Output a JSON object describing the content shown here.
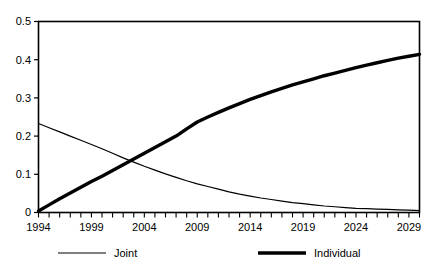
{
  "chart_data": {
    "type": "line",
    "title": "",
    "subtitle": "",
    "xlabel": "",
    "ylabel": "",
    "xlim": [
      1994,
      2030
    ],
    "ylim": [
      0,
      0.5
    ],
    "grid": false,
    "legend_position": "bottom",
    "x_tick_labels": [
      "1994",
      "1999",
      "2004",
      "2009",
      "2014",
      "2019",
      "2024",
      "2029"
    ],
    "x_tick_values": [
      1994,
      1999,
      2004,
      2009,
      2014,
      2019,
      2024,
      2029
    ],
    "x_minor_tick_step": 1,
    "y_tick_labels": [
      "0",
      "0.1",
      "0.2",
      "0.3",
      "0.4",
      "0.5"
    ],
    "y_tick_values": [
      0,
      0.1,
      0.2,
      0.3,
      0.4,
      0.5
    ],
    "x": [
      1994,
      1995,
      1996,
      1997,
      1998,
      1999,
      2000,
      2001,
      2002,
      2003,
      2004,
      2005,
      2006,
      2007,
      2008,
      2009,
      2010,
      2011,
      2012,
      2013,
      2014,
      2015,
      2016,
      2017,
      2018,
      2019,
      2020,
      2021,
      2022,
      2023,
      2024,
      2025,
      2026,
      2027,
      2028,
      2029,
      2030
    ],
    "series": [
      {
        "name": "Joint",
        "line_style": "thin",
        "color": "#000000",
        "values": [
          0.233,
          0.222,
          0.211,
          0.2,
          0.189,
          0.178,
          0.167,
          0.155,
          0.143,
          0.132,
          0.121,
          0.111,
          0.101,
          0.092,
          0.083,
          0.075,
          0.068,
          0.061,
          0.054,
          0.048,
          0.043,
          0.038,
          0.034,
          0.03,
          0.026,
          0.023,
          0.02,
          0.017,
          0.015,
          0.013,
          0.011,
          0.01,
          0.009,
          0.008,
          0.007,
          0.006,
          0.005
        ]
      },
      {
        "name": "Individual",
        "line_style": "thick",
        "color": "#000000",
        "values": [
          0.004,
          0.02,
          0.036,
          0.051,
          0.066,
          0.081,
          0.095,
          0.11,
          0.125,
          0.14,
          0.155,
          0.17,
          0.185,
          0.2,
          0.219,
          0.237,
          0.25,
          0.262,
          0.274,
          0.285,
          0.296,
          0.306,
          0.316,
          0.325,
          0.334,
          0.342,
          0.35,
          0.358,
          0.365,
          0.372,
          0.379,
          0.386,
          0.392,
          0.398,
          0.404,
          0.409,
          0.414
        ]
      }
    ],
    "legend": [
      {
        "label": "Joint",
        "style": "thin"
      },
      {
        "label": "Individual",
        "style": "thick"
      }
    ]
  }
}
